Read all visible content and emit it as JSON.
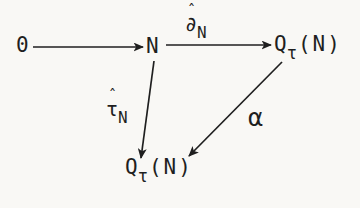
{
  "page": {
    "background_color": "#f9f8f5",
    "ink_color": "#1f1f1f"
  },
  "diagram": {
    "nodes": {
      "zero": {
        "label": "0"
      },
      "n": {
        "label": "N"
      },
      "q_top": {
        "base": "Q",
        "sub": "τ",
        "args": "(N)"
      },
      "q_bottom": {
        "base": "Q",
        "sub": "τ",
        "args": "(N)"
      }
    },
    "arrow_labels": {
      "delta": {
        "hat": "ˆ",
        "base": "∂",
        "sub": "N"
      },
      "tau": {
        "hat": "ˆ",
        "base": "τ",
        "sub": "N"
      },
      "alpha": {
        "label": "α"
      }
    },
    "arrows": [
      {
        "name": "arrow-zero-to-N"
      },
      {
        "name": "arrow-N-to-Q-tau-N-top"
      },
      {
        "name": "arrow-N-to-Q-tau-N-bottom"
      },
      {
        "name": "arrow-Q-tau-N-top-to-bottom"
      }
    ]
  }
}
